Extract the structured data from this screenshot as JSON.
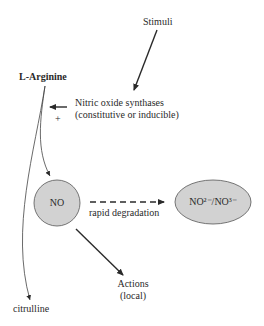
{
  "diagram": {
    "nodes": {
      "stimuli": "Stimuli",
      "arginine": "L-Arginine",
      "enzyme_line1": "Nitric oxide synthases",
      "enzyme_line2": "(constitutive or inducible)",
      "plus": "+",
      "no": "NO",
      "degradation_label": "rapid degradation",
      "products": "NO²⁻/NO³⁻",
      "actions_line1": "Actions",
      "actions_line2": "(local)",
      "citrulline": "citrulline"
    },
    "colors": {
      "node_fill": "#d2d2d2",
      "stroke": "#2a2a2a"
    },
    "edges": [
      {
        "from": "stimuli",
        "to": "enzyme",
        "style": "solid"
      },
      {
        "from": "enzyme",
        "to": "arginine-pathway",
        "style": "solid"
      },
      {
        "from": "arginine",
        "to": "no",
        "style": "solid"
      },
      {
        "from": "arginine",
        "to": "citrulline",
        "style": "solid"
      },
      {
        "from": "no",
        "to": "products",
        "style": "dashed",
        "label": "rapid degradation"
      },
      {
        "from": "no",
        "to": "actions",
        "style": "solid"
      }
    ]
  }
}
